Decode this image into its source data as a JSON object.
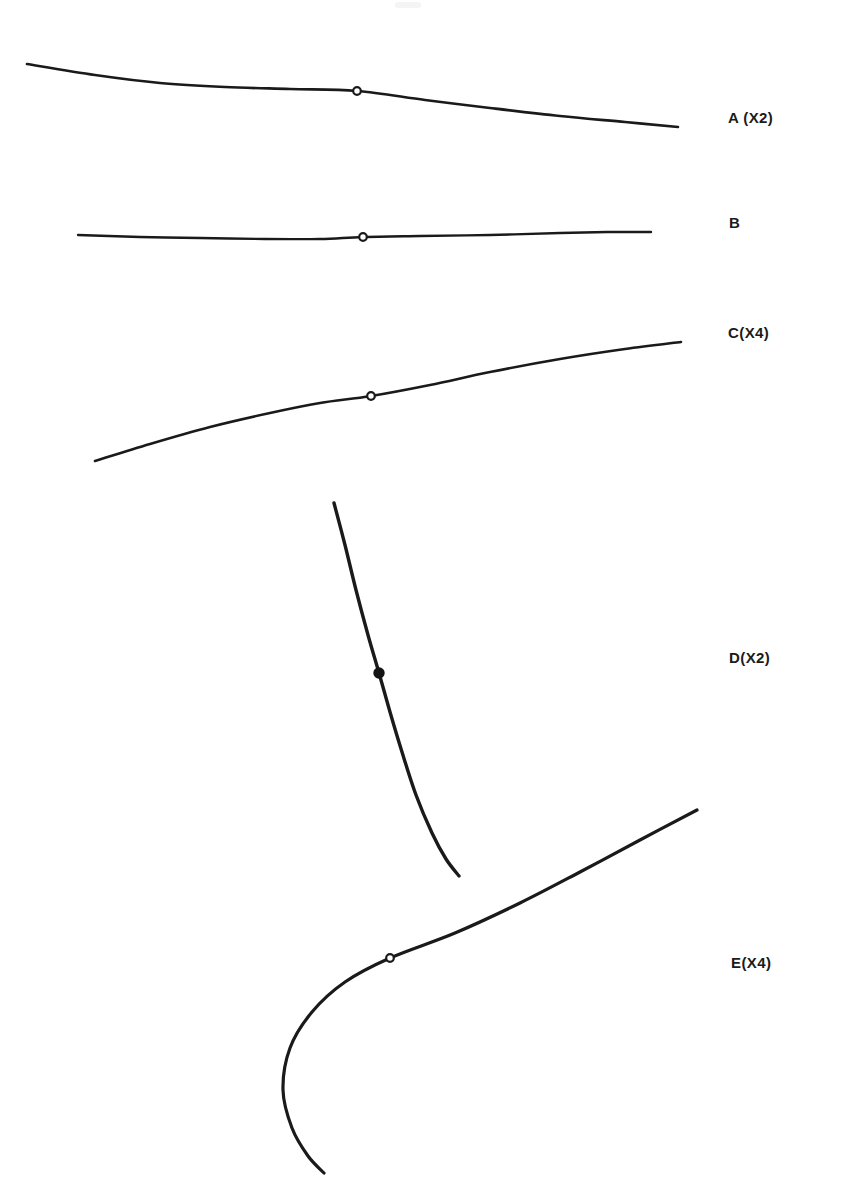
{
  "figure": {
    "title": "",
    "background_color": "#ffffff",
    "stroke_color": "#1a1a1a",
    "width": 841,
    "height": 1204
  },
  "labels": [
    {
      "id": "A",
      "text": "A (X2)",
      "x": 728,
      "y": 110
    },
    {
      "id": "B",
      "text": "B",
      "x": 729,
      "y": 215
    },
    {
      "id": "C",
      "text": "C(X4)",
      "x": 728,
      "y": 325
    },
    {
      "id": "D",
      "text": "D(X2)",
      "x": 729,
      "y": 650
    },
    {
      "id": "E",
      "text": "E(X4)",
      "x": 731,
      "y": 955
    }
  ],
  "chart_data": {
    "type": "line",
    "title": "",
    "xlabel": "",
    "ylabel": "",
    "grid": false,
    "axes_shown": false,
    "legend_position": "right-inline-labels",
    "note": "Hand-drawn scanned figure: five unlabeled-axis curves A-E, each with a single marker point. Values are pixel coordinates read off the scan (y increases downward).",
    "series": [
      {
        "name": "A (X2)",
        "marker_style": "open-circle",
        "marker_point": [
          357,
          91
        ],
        "stroke_width": 2.6,
        "points": [
          [
            27,
            64
          ],
          [
            95,
            75
          ],
          [
            160,
            83
          ],
          [
            225,
            87
          ],
          [
            290,
            89
          ],
          [
            357,
            91
          ],
          [
            425,
            100
          ],
          [
            490,
            108
          ],
          [
            560,
            116
          ],
          [
            625,
            122
          ],
          [
            678,
            127
          ]
        ]
      },
      {
        "name": "B",
        "marker_style": "open-circle",
        "marker_point": [
          363,
          237
        ],
        "stroke_width": 2.4,
        "points": [
          [
            78,
            235
          ],
          [
            140,
            237
          ],
          [
            200,
            238
          ],
          [
            265,
            239
          ],
          [
            320,
            239
          ],
          [
            363,
            237
          ],
          [
            420,
            236
          ],
          [
            490,
            235
          ],
          [
            560,
            233
          ],
          [
            610,
            232
          ],
          [
            651,
            232
          ]
        ]
      },
      {
        "name": "C(X4)",
        "marker_style": "open-circle",
        "marker_point": [
          371,
          396
        ],
        "stroke_width": 2.6,
        "points": [
          [
            95,
            461
          ],
          [
            150,
            444
          ],
          [
            210,
            427
          ],
          [
            270,
            413
          ],
          [
            320,
            403
          ],
          [
            371,
            396
          ],
          [
            430,
            385
          ],
          [
            490,
            372
          ],
          [
            560,
            359
          ],
          [
            625,
            349
          ],
          [
            681,
            342
          ]
        ]
      },
      {
        "name": "D(X2)",
        "marker_style": "filled-circle",
        "marker_point": [
          379,
          673
        ],
        "stroke_width": 3.4,
        "points": [
          [
            334,
            503
          ],
          [
            345,
            545
          ],
          [
            356,
            590
          ],
          [
            368,
            635
          ],
          [
            379,
            673
          ],
          [
            390,
            712
          ],
          [
            402,
            752
          ],
          [
            416,
            795
          ],
          [
            432,
            833
          ],
          [
            446,
            859
          ],
          [
            459,
            876
          ]
        ]
      },
      {
        "name": "E(X4)",
        "marker_style": "open-circle",
        "marker_point": [
          390,
          958
        ],
        "stroke_width": 3.2,
        "points": [
          [
            697,
            810
          ],
          [
            640,
            840
          ],
          [
            580,
            872
          ],
          [
            520,
            903
          ],
          [
            455,
            933
          ],
          [
            390,
            958
          ],
          [
            345,
            982
          ],
          [
            312,
            1012
          ],
          [
            290,
            1048
          ],
          [
            283,
            1090
          ],
          [
            292,
            1128
          ],
          [
            308,
            1156
          ],
          [
            324,
            1173
          ]
        ]
      }
    ]
  }
}
